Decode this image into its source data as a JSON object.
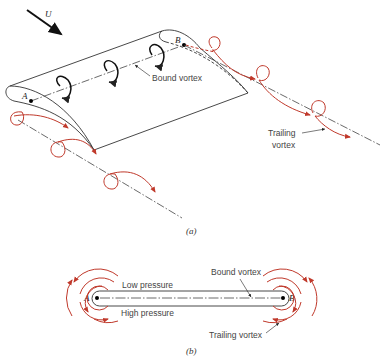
{
  "figure": {
    "panel_a": {
      "caption": "(a)",
      "flow_label": "U",
      "point_a": "A",
      "point_b": "B",
      "bound_vortex_label": "Bound vortex",
      "trailing_vortex_label_line1": "Trailing",
      "trailing_vortex_label_line2": "vortex"
    },
    "panel_b": {
      "caption": "(b)",
      "point_a": "A",
      "point_b": "B",
      "low_pressure_label": "Low pressure",
      "high_pressure_label": "High pressure",
      "bound_vortex_label": "Bound vortex",
      "trailing_vortex_label": "Trailing vortex"
    },
    "colors": {
      "line": "#333333",
      "vortex": "#c0392b",
      "background": "#ffffff"
    }
  }
}
